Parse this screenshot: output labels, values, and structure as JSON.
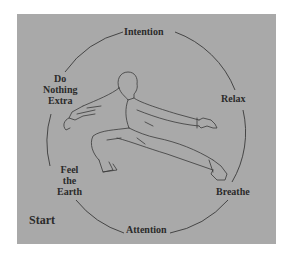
{
  "diagram": {
    "colors": {
      "background": "#ffffff",
      "panel": "#a9a9a9",
      "ink": "#2b2b2b"
    },
    "cycle_labels": [
      {
        "id": "intention",
        "text": "Intention"
      },
      {
        "id": "relax",
        "text": "Relax"
      },
      {
        "id": "breathe",
        "text": "Breathe"
      },
      {
        "id": "attention",
        "text": "Attention"
      },
      {
        "id": "feel-the-earth",
        "lines": [
          "Feel",
          "the",
          "Earth"
        ]
      },
      {
        "id": "do-nothing-extra",
        "lines": [
          "Do",
          "Nothing",
          "Extra"
        ]
      }
    ],
    "start_label": "Start",
    "figure": "martial-artist-low-stance-line-drawing"
  }
}
